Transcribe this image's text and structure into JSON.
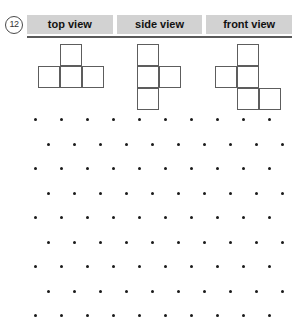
{
  "problem": {
    "number": "12"
  },
  "header": {
    "columns": [
      {
        "label": "top view"
      },
      {
        "label": "side view"
      },
      {
        "label": "front view"
      }
    ],
    "background_color": "#d2d2d2",
    "rule_color": "#5a5a5a"
  },
  "figures": [
    {
      "name": "top-view-shape",
      "description": "T-tetromino: horizontal row of three squares with one square above the middle",
      "cell_size": 22,
      "cells": [
        {
          "col": 1,
          "row": 0
        },
        {
          "col": 0,
          "row": 1
        },
        {
          "col": 1,
          "row": 1
        },
        {
          "col": 2,
          "row": 1
        }
      ],
      "cols": 3,
      "rows": 2,
      "stroke_color": "#5d5d5d",
      "fill_color": "#ffffff"
    },
    {
      "name": "side-view-shape",
      "description": "Vertical column of three squares with one square attached to the right of the middle",
      "cell_size": 22,
      "cells": [
        {
          "col": 0,
          "row": 0
        },
        {
          "col": 0,
          "row": 1
        },
        {
          "col": 1,
          "row": 1
        },
        {
          "col": 0,
          "row": 2
        }
      ],
      "cols": 2,
      "rows": 3,
      "stroke_color": "#5d5d5d",
      "fill_color": "#ffffff"
    },
    {
      "name": "front-view-shape",
      "description": "Staircase arrangement of five squares across a three by three area",
      "cell_size": 22,
      "cells": [
        {
          "col": 1,
          "row": 0
        },
        {
          "col": 0,
          "row": 1
        },
        {
          "col": 1,
          "row": 1
        },
        {
          "col": 1,
          "row": 2
        },
        {
          "col": 2,
          "row": 2
        }
      ],
      "cols": 3,
      "rows": 3,
      "stroke_color": "#5d5d5d",
      "fill_color": "#ffffff"
    }
  ],
  "dot_grid": {
    "name": "isometric-dot-paper",
    "rows": 9,
    "dots_per_row": 10,
    "x_start": 34,
    "x_spacing": 26,
    "row_offset": 13,
    "y_start": 6,
    "y_spacing": 24.5,
    "dot_color": "#1a1a1a",
    "dot_size": 3
  }
}
